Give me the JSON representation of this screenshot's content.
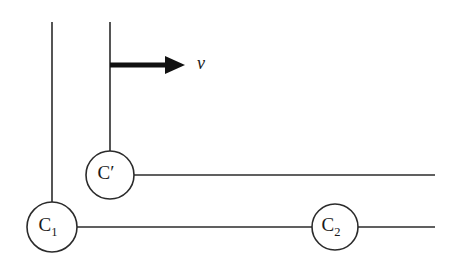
{
  "figure": {
    "name": "moving-contour-diagram",
    "width": 457,
    "height": 267,
    "background_color": "#ffffff",
    "line_color": "#2b2b2b",
    "arrow_color": "#111111"
  },
  "nodes": [
    {
      "id": "c-prime",
      "label_base": "C",
      "label_modifier": "′",
      "label_full": "C′",
      "cx": 110,
      "cy": 175,
      "r": 24
    },
    {
      "id": "c-one",
      "label_base": "C",
      "label_modifier": "1",
      "label_full": "C1",
      "cx": 52,
      "cy": 227,
      "r": 25
    },
    {
      "id": "c-two",
      "label_base": "C",
      "label_modifier": "2",
      "label_full": "C2",
      "cx": 335,
      "cy": 227,
      "r": 23
    }
  ],
  "wires": [
    {
      "id": "vertical-left",
      "x1": 52,
      "y1": 22,
      "x2": 52,
      "y2": 202
    },
    {
      "id": "vertical-middle",
      "x1": 110,
      "y1": 22,
      "x2": 110,
      "y2": 151
    },
    {
      "id": "horizontal-c-prime",
      "x1": 134,
      "y1": 175,
      "x2": 435,
      "y2": 175
    },
    {
      "id": "horizontal-baseline",
      "x1": 77,
      "y1": 227,
      "x2": 435,
      "y2": 227
    }
  ],
  "arrow": {
    "id": "velocity-arrow",
    "x_start": 110,
    "x_tip": 185,
    "y": 65,
    "shaft_width": 5.2,
    "head_length": 20,
    "head_half_height": 9
  },
  "velocity_label": {
    "text": "v",
    "x": 201,
    "y": 65,
    "style": "italic"
  }
}
